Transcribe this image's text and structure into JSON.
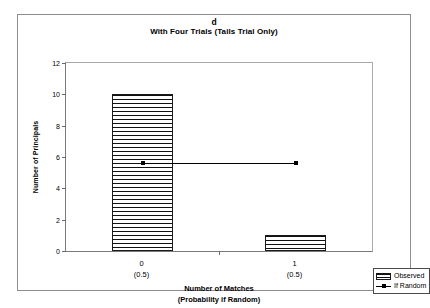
{
  "chart_data": {
    "type": "bar",
    "panel_letter": "d",
    "title": "With Four Trials (Tails Trial Only)",
    "categories": [
      "0",
      "1"
    ],
    "category_sublabels": [
      "(0.5)",
      "(0.5)"
    ],
    "xlabel": "Number of Matches",
    "xlabel_sub": "(Probability if Random)",
    "ylabel": "Number of Principals",
    "ylim": [
      0,
      12
    ],
    "ytick_step": 2,
    "yticks": [
      0,
      2,
      4,
      6,
      8,
      10,
      12
    ],
    "ytick_labels": [
      "0",
      "2",
      "4",
      "6",
      "8",
      "10",
      "12"
    ],
    "grid": false,
    "legend_position": "bottom-right",
    "series": [
      {
        "name": "Observed",
        "kind": "bar",
        "values": [
          10,
          1
        ],
        "color": "#111111"
      },
      {
        "name": "If Random",
        "kind": "line",
        "values": [
          5.6,
          5.6
        ],
        "color": "#000000"
      }
    ]
  },
  "legend": {
    "items": [
      {
        "label": "Observed"
      },
      {
        "label": "If Random"
      }
    ]
  }
}
